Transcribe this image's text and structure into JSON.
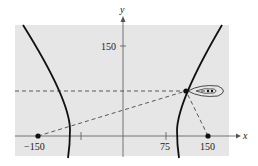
{
  "diagram": {
    "type": "hyperbola-location",
    "axes": {
      "x_label": "x",
      "y_label": "y"
    },
    "tick_labels": {
      "y_150": "150",
      "x_neg150": "−150",
      "x_75": "75",
      "x_150": "150"
    },
    "foci": [
      {
        "x": -150,
        "y": 0
      },
      {
        "x": 150,
        "y": 0
      }
    ],
    "point_on_curve": "boat location on right branch",
    "colors": {
      "background": "#e6e6e6",
      "curve": "#111111",
      "dash": "#333333"
    }
  }
}
